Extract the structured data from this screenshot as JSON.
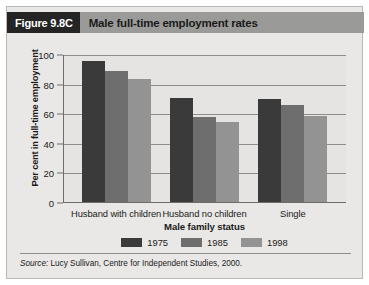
{
  "header": {
    "figure_number": "Figure 9.8C",
    "title": "Male full-time employment rates",
    "number_bg_color": "#242424",
    "band_bg_color": "#9a9a98"
  },
  "source": {
    "label": "Source:",
    "text": "Lucy Sullivan, Centre for Independent Studies, 2000."
  },
  "chart_data": {
    "type": "bar",
    "title": "Male full-time employment rates",
    "xlabel": "Male family status",
    "ylabel": "Per cent in full-time employment",
    "categories": [
      "Husband with children",
      "Husband no children",
      "Single"
    ],
    "series": [
      {
        "name": "1975",
        "color": "#3a3a3a",
        "values": [
          96,
          89,
          84
        ]
      },
      {
        "name": "1985",
        "color": "#6e6e6e",
        "values": [
          71,
          58,
          66
        ]
      },
      {
        "name": "1998",
        "color": "#939393",
        "values": [
          55,
          0,
          59
        ]
      }
    ],
    "series_by_group": [
      {
        "category": "Husband with children",
        "bars": [
          {
            "series": "1975",
            "value": 96
          },
          {
            "series": "1985",
            "value": 89
          },
          {
            "series": "1998",
            "value": 84
          }
        ]
      },
      {
        "category": "Husband no children",
        "bars": [
          {
            "series": "1975",
            "value": 71
          },
          {
            "series": "1985",
            "value": 58
          },
          {
            "series": "1998",
            "value": 55
          }
        ]
      },
      {
        "category": "Single",
        "bars": [
          {
            "series": "1975",
            "value": 70
          },
          {
            "series": "1985",
            "value": 66
          },
          {
            "series": "1998",
            "value": 59
          }
        ]
      }
    ],
    "yticks": [
      0,
      20,
      40,
      60,
      80,
      100
    ],
    "ylim": [
      0,
      100
    ],
    "grid": true,
    "legend_position": "bottom",
    "legend": [
      {
        "label": "1975",
        "color": "#3a3a3a"
      },
      {
        "label": "1985",
        "color": "#6e6e6e"
      },
      {
        "label": "1998",
        "color": "#939393"
      }
    ],
    "plot_bg_color": "#e5e4e2",
    "figure_bg_color": "#e9e8e6"
  }
}
